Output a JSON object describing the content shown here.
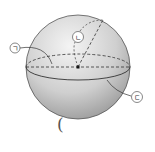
{
  "diagram": {
    "labels": {
      "a": "ㄱ",
      "b": "ㄴ",
      "c": "ㄷ"
    },
    "answer_blank": "("
  },
  "colors": {
    "sphere_light": "#f2f2f2",
    "sphere_dark": "#9a9a9a",
    "stroke": "#333333"
  }
}
